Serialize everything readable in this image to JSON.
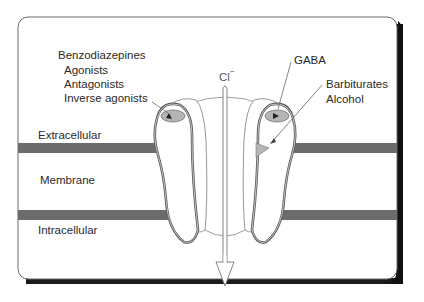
{
  "diagram": {
    "type": "gaba-a-receptor-chloride-channel",
    "frame": {
      "background": "#ffffff",
      "border_color": "#555555",
      "shadow_color": "#111111"
    },
    "membrane": {
      "band_color": "#6b6b6b",
      "regions": {
        "extracellular": "Extracellular",
        "membrane": "Membrane",
        "intracellular": "Intracellular"
      }
    },
    "ion": {
      "label": "Cl",
      "charge": "−",
      "flow_direction": "inward (extracellular to intracellular)"
    },
    "binding_sites": {
      "benzodiazepines": {
        "title": "Benzodiazepines",
        "items": [
          "Agonists",
          "Antagonists",
          "Inverse agonists"
        ]
      },
      "gaba": {
        "title": "GABA"
      },
      "barbiturates": {
        "items": [
          "Barbiturates",
          "Alcohol"
        ]
      }
    },
    "colors": {
      "site_fill": "#b5b5b5",
      "subunit_outline": "#666666",
      "band": "#6b6b6b",
      "text": "#2a2a2a"
    }
  }
}
